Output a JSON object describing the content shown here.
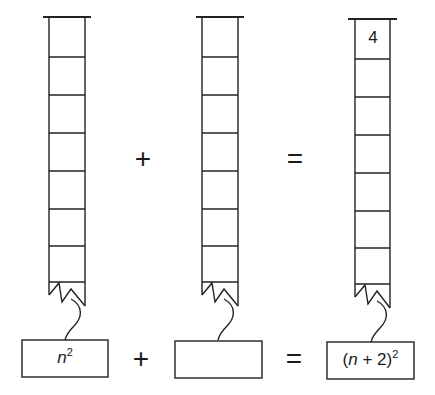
{
  "diagram": {
    "stroke_color": "#222222",
    "background": "#ffffff",
    "columns": [
      {
        "id": "left",
        "cells": 7,
        "top_cell_value": ""
      },
      {
        "id": "middle",
        "cells": 7,
        "top_cell_value": ""
      },
      {
        "id": "right",
        "cells": 7,
        "top_cell_value": "4"
      }
    ],
    "top_operators": {
      "plus": "+",
      "equals": "="
    },
    "bottom_operators": {
      "plus": "+",
      "equals": "="
    },
    "boxes": {
      "left": {
        "var": "n",
        "exp": "2"
      },
      "middle": {
        "text": ""
      },
      "right": {
        "open": "(",
        "var": "n",
        "rest": " + 2)",
        "exp": "2"
      }
    }
  }
}
